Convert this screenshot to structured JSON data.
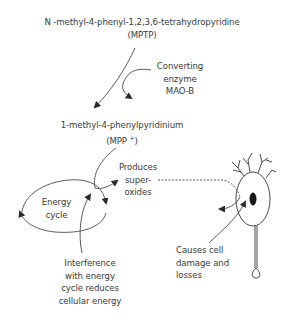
{
  "diagram": {
    "type": "flow",
    "nodes": {
      "mptp": {
        "line1": "N -methyl-4-phenyl-1,2,3,6-tetrahydropyridine",
        "line2": "(MPTP)"
      },
      "enzyme": {
        "lines": [
          "Converting",
          "enzyme",
          "MAO-B"
        ]
      },
      "mpp": {
        "line1": "1-methyl-4-phenylpyridinium",
        "line2_prefix": "(MPP ",
        "line2_sup": "+",
        "line2_suffix": ")"
      },
      "superoxides": {
        "lines": [
          "Produces",
          "super-",
          "oxides"
        ]
      },
      "energy_cycle": {
        "lines": [
          "Energy",
          "cycle"
        ]
      },
      "interference": {
        "lines": [
          "Interference",
          "with energy",
          "cycle reduces",
          "cellular energy"
        ]
      },
      "cell_damage": {
        "lines": [
          "Causes cell",
          "damage and",
          "losses"
        ]
      },
      "neuron": {
        "icon": "neuron-icon"
      }
    },
    "edges": [
      {
        "from": "MPTP",
        "to": "MPP+",
        "style": "solid",
        "via": "Converting enzyme MAO-B"
      },
      {
        "from": "MPP+",
        "to": "Energy cycle",
        "style": "solid",
        "via": "Produces super-oxides"
      },
      {
        "from": "Produces super-oxides",
        "to": "Neuron",
        "style": "dashed"
      },
      {
        "from": "Interference with energy cycle reduces cellular energy",
        "to": "Energy cycle",
        "style": "solid"
      },
      {
        "from": "Causes cell damage and losses",
        "to": "Neuron nucleus",
        "style": "solid"
      }
    ],
    "colors": {
      "line": "#3a3a3a",
      "text": "#3a3a3a",
      "nucleus": "#1a1a1a",
      "background": "#ffffff"
    }
  }
}
